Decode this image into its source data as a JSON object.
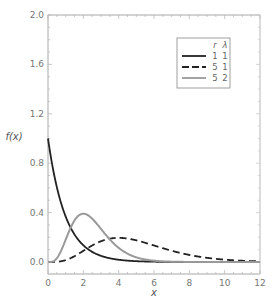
{
  "chart_data": {
    "type": "line",
    "title": "",
    "xlabel": "x",
    "ylabel": "f(x)",
    "xlim": [
      0,
      12
    ],
    "ylim": [
      0,
      2.0
    ],
    "xticks": [
      0,
      2,
      4,
      6,
      8,
      10,
      12
    ],
    "xtick_labels": [
      "0",
      "2",
      "4",
      "6",
      "8",
      "10",
      "12"
    ],
    "yticks": [
      0.0,
      0.4,
      0.8,
      1.2,
      1.6,
      2.0
    ],
    "ytick_labels": [
      "0.0",
      "0.4",
      "0.8",
      "1.2",
      "1.6",
      "2.0"
    ],
    "grid": false,
    "legend": {
      "position": "upper right",
      "headers": [
        "r",
        "λ"
      ],
      "entries": [
        {
          "style": "solid-black",
          "r": "1",
          "lambda": "1"
        },
        {
          "style": "dashed-black",
          "r": "5",
          "lambda": "1"
        },
        {
          "style": "solid-gray",
          "r": "5",
          "lambda": "2"
        }
      ]
    },
    "series": [
      {
        "name": "r=1, λ=1",
        "r": 1,
        "lambda": 1,
        "color": "#222222",
        "dash": "solid",
        "x": [
          0,
          0.5,
          1,
          1.5,
          2,
          2.5,
          3,
          4,
          5,
          6,
          8,
          10,
          12
        ],
        "y": [
          2.0,
          1.21,
          0.74,
          0.45,
          0.27,
          0.16,
          0.1,
          0.04,
          0.01,
          0.005,
          0.0,
          0.0,
          0.0
        ]
      },
      {
        "name": "r=5, λ=1",
        "r": 5,
        "lambda": 1,
        "color": "#222222",
        "dash": "dashed",
        "x": [
          0,
          1,
          2,
          3,
          4,
          5,
          6,
          7,
          8,
          9,
          10,
          11,
          12
        ],
        "y": [
          0.0,
          0.02,
          0.09,
          0.22,
          0.4,
          0.35,
          0.27,
          0.19,
          0.12,
          0.08,
          0.05,
          0.03,
          0.02
        ]
      },
      {
        "name": "r=5, λ=2",
        "r": 5,
        "lambda": 2,
        "color": "#999999",
        "dash": "solid",
        "x": [
          0,
          0.5,
          1,
          1.5,
          2,
          2.5,
          3,
          3.5,
          4,
          5,
          6,
          7
        ],
        "y": [
          0.0,
          0.02,
          0.18,
          0.54,
          0.8,
          0.67,
          0.45,
          0.27,
          0.14,
          0.03,
          0.01,
          0.0
        ]
      }
    ]
  }
}
